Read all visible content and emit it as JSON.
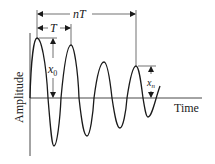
{
  "diagram": {
    "type": "damped-oscillation",
    "axes": {
      "x_label": "Time",
      "y_label": "Amplitude"
    },
    "annotations": {
      "period_label": "T",
      "n_periods_label": "nT",
      "initial_amplitude_label": "x",
      "initial_amplitude_sub": "0",
      "nth_amplitude_label": "x",
      "nth_amplitude_sub": "n"
    },
    "curve": {
      "baseline_y": 98,
      "peaks": [
        [
          37,
          38
        ],
        [
          71,
          45
        ],
        [
          104,
          62
        ],
        [
          136,
          66
        ]
      ],
      "troughs": [
        [
          54,
          146
        ],
        [
          87,
          136
        ],
        [
          120,
          128
        ],
        [
          148,
          117
        ]
      ],
      "end": [
        160,
        86
      ]
    },
    "colors": {
      "stroke": "#1a1a1a",
      "background": "#ffffff"
    }
  }
}
